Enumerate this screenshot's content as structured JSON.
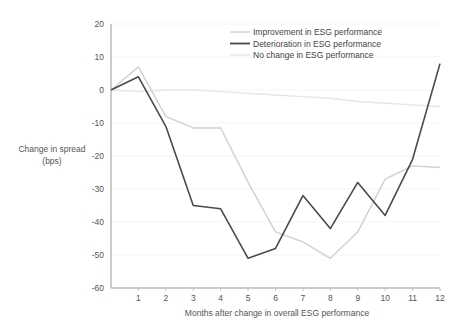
{
  "chart_data": {
    "type": "line",
    "title": "",
    "xlabel": "Months after change in overall ESG performance",
    "ylabel": "Change in spread\n(bps)",
    "ylabel_line1": "Change in spread",
    "ylabel_line2": "(bps)",
    "x": [
      0,
      1,
      2,
      3,
      4,
      5,
      6,
      7,
      8,
      9,
      10,
      11,
      12
    ],
    "xtick_labels": [
      "1",
      "2",
      "3",
      "4",
      "5",
      "6",
      "7",
      "8",
      "9",
      "10",
      "11",
      "12"
    ],
    "xtick_values": [
      1,
      2,
      3,
      4,
      5,
      6,
      7,
      8,
      9,
      10,
      11,
      12
    ],
    "ytick_labels": [
      "20",
      "10",
      "0",
      "-10",
      "-20",
      "-30",
      "-40",
      "-50",
      "-60"
    ],
    "ytick_values": [
      20,
      10,
      0,
      -10,
      -20,
      -30,
      -40,
      -50,
      -60
    ],
    "xlim": [
      0,
      12
    ],
    "ylim": [
      -60,
      20
    ],
    "grid": true,
    "legend_position": "top-right",
    "series": [
      {
        "name": "Improvement in ESG performance",
        "color": "#d0d0d0",
        "width": 1.4,
        "values": [
          0,
          7,
          -8,
          -11.5,
          -11.5,
          -28,
          -43,
          -46,
          -51,
          -43,
          -27,
          -23,
          -23.5
        ]
      },
      {
        "name": "Deterioration in ESG performance",
        "color": "#4a4a4a",
        "width": 1.6,
        "values": [
          0,
          4,
          -11,
          -35,
          -36,
          -51,
          -48,
          -32,
          -42,
          -28,
          -38,
          -21,
          8
        ]
      },
      {
        "name": "No change in ESG performance",
        "color": "#e6e6e6",
        "width": 1.4,
        "values": [
          0,
          -0.5,
          0,
          0,
          -0.5,
          -1,
          -1.5,
          -2,
          -2.5,
          -3.5,
          -4,
          -4.5,
          -5
        ]
      }
    ]
  },
  "legend": {
    "items": [
      {
        "label": "Improvement in ESG performance",
        "color": "#d0d0d0"
      },
      {
        "label": "Deterioration in ESG performance",
        "color": "#4a4a4a"
      },
      {
        "label": "No change in ESG performance",
        "color": "#e6e6e6"
      }
    ]
  },
  "axes": {
    "x_title": "Months after change in overall ESG performance",
    "y_title_line1": "Change in spread",
    "y_title_line2": "(bps)"
  }
}
